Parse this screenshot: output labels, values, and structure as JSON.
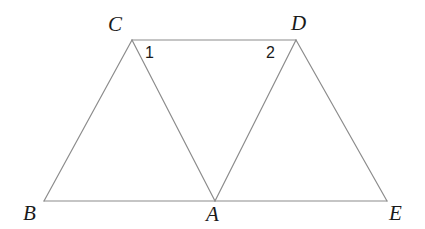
{
  "figure": {
    "background_color": "#ffffff",
    "stroke_color": "#8c8c8c",
    "stroke_width": 1.2,
    "label_color": "#1a1a1a",
    "canvas": {
      "width": 425,
      "height": 229
    },
    "points": [
      {
        "name": "B",
        "label": "B",
        "x": 44,
        "y": 201,
        "label_x": 23,
        "label_y": 203
      },
      {
        "name": "A",
        "label": "A",
        "x": 215,
        "y": 201,
        "label_x": 206,
        "label_y": 204
      },
      {
        "name": "E",
        "label": "E",
        "x": 387,
        "y": 201,
        "label_x": 389,
        "label_y": 203
      },
      {
        "name": "C",
        "label": "C",
        "x": 132,
        "y": 40,
        "label_x": 108,
        "label_y": 14
      },
      {
        "name": "D",
        "label": "D",
        "x": 296,
        "y": 40,
        "label_x": 291,
        "label_y": 13
      }
    ],
    "segments": [
      {
        "name": "segment-BC",
        "from": "B",
        "to": "C"
      },
      {
        "name": "segment-CA",
        "from": "C",
        "to": "A"
      },
      {
        "name": "segment-AD",
        "from": "A",
        "to": "D"
      },
      {
        "name": "segment-DE",
        "from": "D",
        "to": "E"
      },
      {
        "name": "segment-BE",
        "from": "B",
        "to": "E"
      },
      {
        "name": "segment-CD",
        "from": "C",
        "to": "D"
      }
    ],
    "angle_labels": [
      {
        "name": "angle-1",
        "label": "1",
        "at_vertex": "C",
        "x": 145,
        "y": 45
      },
      {
        "name": "angle-2",
        "label": "2",
        "at_vertex": "D",
        "x": 266,
        "y": 45
      }
    ]
  }
}
